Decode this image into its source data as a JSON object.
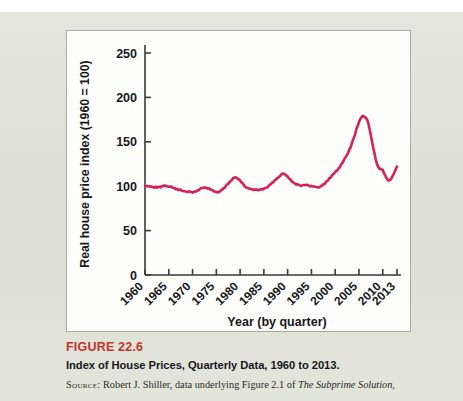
{
  "figure": {
    "number_label": "FIGURE 22.6",
    "title": "Index of House Prices, Quarterly Data, 1960 to 2013.",
    "source_prefix": "Source:",
    "source_text_1": " Robert J. Shiller, data underlying Figure 2.1 of ",
    "source_italic": "The Subprime Solution",
    "source_text_2": ",",
    "number_color": "#c3342b",
    "title_color": "#16181f"
  },
  "chart_data": {
    "type": "line",
    "title": "",
    "xlabel": "Year (by quarter)",
    "ylabel": "Real house price index (1960 = 100)",
    "xlim": [
      1960,
      2013
    ],
    "ylim": [
      0,
      250
    ],
    "grid": false,
    "legend": null,
    "line_color": "#d62158",
    "xticks": [
      1960,
      1965,
      1970,
      1975,
      1980,
      1985,
      1990,
      1995,
      2000,
      2005,
      2010,
      2013
    ],
    "xticklabels": [
      "1960",
      "1965",
      "1970",
      "1975",
      "1980",
      "1985",
      "1990",
      "1995",
      "2000",
      "2005",
      "2010",
      "2013"
    ],
    "xtick_rotation": 45,
    "yticks": [
      0,
      50,
      100,
      150,
      200,
      250
    ],
    "yticklabels": [
      "0",
      "50",
      "100",
      "150",
      "200",
      "250"
    ],
    "series": [
      {
        "name": "Real house price index",
        "x": [
          1960,
          1961,
          1962,
          1963,
          1964,
          1965,
          1966,
          1967,
          1968,
          1969,
          1970,
          1971,
          1972,
          1973,
          1974,
          1975,
          1976,
          1977,
          1978,
          1979,
          1980,
          1981,
          1982,
          1983,
          1984,
          1985,
          1986,
          1987,
          1988,
          1989,
          1990,
          1991,
          1992,
          1993,
          1994,
          1995,
          1996,
          1997,
          1998,
          1999,
          2000,
          2001,
          2002,
          2003,
          2004,
          2005,
          2006,
          2007,
          2008,
          2009,
          2010,
          2011,
          2012,
          2013
        ],
        "values": [
          100,
          100,
          99,
          99,
          100,
          100,
          98,
          96,
          95,
          94,
          93,
          95,
          98,
          98,
          96,
          93,
          95,
          100,
          106,
          110,
          106,
          100,
          97,
          96,
          96,
          97,
          100,
          105,
          110,
          114,
          111,
          105,
          102,
          101,
          101,
          100,
          99,
          100,
          104,
          110,
          116,
          122,
          131,
          141,
          156,
          172,
          179,
          170,
          143,
          122,
          118,
          107,
          110,
          122
        ]
      }
    ],
    "annotations": []
  },
  "icons": {
    "none": ""
  }
}
